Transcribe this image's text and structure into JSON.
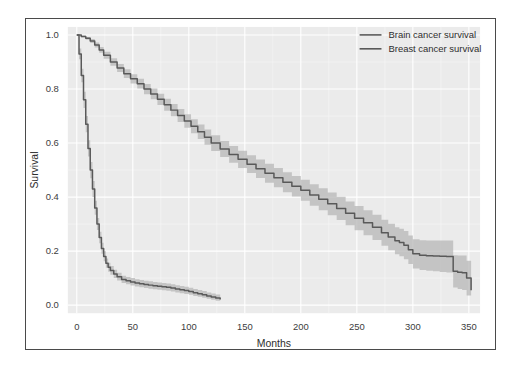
{
  "chart_data": {
    "type": "line",
    "title": "",
    "xlabel": "Months",
    "ylabel": "Survival",
    "xlim": [
      -8,
      360
    ],
    "ylim": [
      -0.03,
      1.03
    ],
    "xticks": [
      0,
      50,
      100,
      150,
      200,
      250,
      300,
      350
    ],
    "xtick_labels": [
      "0",
      "50",
      "100",
      "150",
      "200",
      "250",
      "300",
      "350"
    ],
    "yticks": [
      0.0,
      0.2,
      0.4,
      0.6,
      0.8,
      1.0
    ],
    "ytick_labels": [
      "0.0",
      "0.2",
      "0.4",
      "0.6",
      "0.8",
      "1.0"
    ],
    "grid": true,
    "grid_color": "#ffffff",
    "panel_background": "#ebebeb",
    "legend_position": "top-right",
    "legend": [
      "Brain cancer survival",
      "Breast cancer survival"
    ],
    "series": [
      {
        "name": "Brain cancer survival",
        "color": "#595959",
        "band_color": "#b4b4b4",
        "x": [
          0,
          2,
          4,
          6,
          8,
          10,
          12,
          14,
          16,
          18,
          20,
          22,
          24,
          26,
          28,
          30,
          33,
          36,
          40,
          44,
          48,
          52,
          56,
          60,
          64,
          68,
          72,
          76,
          80,
          84,
          88,
          92,
          96,
          100,
          104,
          108,
          112,
          116,
          120,
          124,
          128
        ],
        "y": [
          1.0,
          0.93,
          0.85,
          0.76,
          0.67,
          0.58,
          0.5,
          0.43,
          0.36,
          0.3,
          0.25,
          0.21,
          0.18,
          0.155,
          0.14,
          0.128,
          0.115,
          0.105,
          0.095,
          0.09,
          0.086,
          0.082,
          0.079,
          0.076,
          0.074,
          0.072,
          0.07,
          0.068,
          0.066,
          0.063,
          0.06,
          0.057,
          0.054,
          0.05,
          0.046,
          0.042,
          0.038,
          0.034,
          0.03,
          0.026,
          0.021
        ],
        "lower": [
          1.0,
          0.91,
          0.825,
          0.73,
          0.64,
          0.55,
          0.47,
          0.4,
          0.335,
          0.278,
          0.229,
          0.19,
          0.162,
          0.138,
          0.124,
          0.112,
          0.1,
          0.091,
          0.082,
          0.077,
          0.073,
          0.069,
          0.066,
          0.063,
          0.061,
          0.059,
          0.057,
          0.055,
          0.053,
          0.05,
          0.047,
          0.044,
          0.041,
          0.038,
          0.034,
          0.031,
          0.027,
          0.024,
          0.02,
          0.016,
          0.012
        ],
        "upper": [
          1.0,
          0.95,
          0.875,
          0.79,
          0.7,
          0.61,
          0.53,
          0.46,
          0.386,
          0.323,
          0.272,
          0.231,
          0.199,
          0.173,
          0.157,
          0.145,
          0.131,
          0.12,
          0.109,
          0.104,
          0.1,
          0.096,
          0.093,
          0.09,
          0.088,
          0.086,
          0.084,
          0.082,
          0.08,
          0.077,
          0.074,
          0.071,
          0.068,
          0.064,
          0.06,
          0.056,
          0.052,
          0.047,
          0.043,
          0.039,
          0.034
        ]
      },
      {
        "name": "Breast cancer survival",
        "color": "#595959",
        "band_color": "#b4b4b4",
        "x": [
          0,
          4,
          8,
          12,
          16,
          20,
          24,
          30,
          36,
          42,
          48,
          54,
          60,
          66,
          72,
          78,
          84,
          90,
          96,
          102,
          108,
          114,
          120,
          128,
          136,
          144,
          152,
          160,
          168,
          176,
          184,
          192,
          200,
          208,
          216,
          224,
          232,
          240,
          248,
          256,
          264,
          272,
          278,
          284,
          288,
          292,
          296,
          300,
          306,
          312,
          318,
          324,
          330,
          336,
          340,
          344,
          348,
          352
        ],
        "y": [
          1.0,
          0.995,
          0.988,
          0.978,
          0.963,
          0.945,
          0.925,
          0.9,
          0.878,
          0.857,
          0.838,
          0.82,
          0.8,
          0.782,
          0.762,
          0.742,
          0.722,
          0.702,
          0.682,
          0.662,
          0.642,
          0.622,
          0.6,
          0.578,
          0.558,
          0.54,
          0.522,
          0.505,
          0.488,
          0.472,
          0.455,
          0.44,
          0.425,
          0.408,
          0.392,
          0.375,
          0.358,
          0.34,
          0.322,
          0.305,
          0.288,
          0.268,
          0.252,
          0.238,
          0.232,
          0.222,
          0.205,
          0.19,
          0.185,
          0.183,
          0.182,
          0.181,
          0.18,
          0.125,
          0.122,
          0.12,
          0.1,
          0.055
        ],
        "lower": [
          1.0,
          0.992,
          0.983,
          0.971,
          0.954,
          0.934,
          0.912,
          0.886,
          0.863,
          0.841,
          0.821,
          0.802,
          0.781,
          0.762,
          0.741,
          0.72,
          0.699,
          0.678,
          0.657,
          0.636,
          0.615,
          0.594,
          0.571,
          0.548,
          0.527,
          0.508,
          0.489,
          0.471,
          0.453,
          0.436,
          0.418,
          0.402,
          0.386,
          0.368,
          0.351,
          0.333,
          0.315,
          0.296,
          0.277,
          0.259,
          0.241,
          0.22,
          0.203,
          0.188,
          0.181,
          0.17,
          0.152,
          0.136,
          0.13,
          0.127,
          0.125,
          0.123,
          0.121,
          0.065,
          0.06,
          0.056,
          0.036,
          0.005
        ],
        "upper": [
          1.0,
          0.998,
          0.993,
          0.985,
          0.972,
          0.956,
          0.938,
          0.914,
          0.893,
          0.873,
          0.855,
          0.838,
          0.819,
          0.802,
          0.783,
          0.764,
          0.745,
          0.726,
          0.707,
          0.688,
          0.669,
          0.65,
          0.629,
          0.608,
          0.589,
          0.572,
          0.555,
          0.539,
          0.523,
          0.508,
          0.492,
          0.478,
          0.464,
          0.448,
          0.433,
          0.417,
          0.401,
          0.384,
          0.367,
          0.351,
          0.335,
          0.316,
          0.301,
          0.288,
          0.283,
          0.274,
          0.258,
          0.244,
          0.24,
          0.239,
          0.239,
          0.239,
          0.239,
          0.185,
          0.184,
          0.184,
          0.164,
          0.105
        ]
      }
    ]
  }
}
